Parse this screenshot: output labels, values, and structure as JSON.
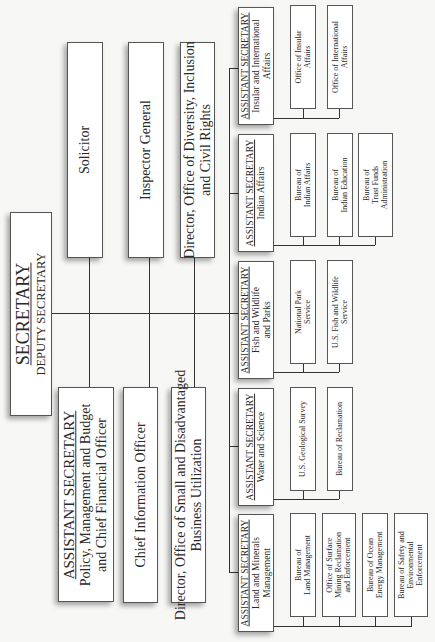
{
  "chart": {
    "orientation": "rotated-90-ccw",
    "root": {
      "title": "SECRETARY",
      "subtitle": "DEPUTY SECRETARY"
    },
    "staff_top": [
      {
        "lines": [
          "Solicitor"
        ]
      },
      {
        "lines": [
          "Inspector General"
        ]
      },
      {
        "lines": [
          "Director, Office of Diversity, Inclusion",
          "and Civil Rights"
        ]
      }
    ],
    "staff_bottom": [
      {
        "title": "ASSISTANT SECRETARY",
        "lines": [
          "Policy, Management and Budget",
          "and Chief Financial Officer"
        ]
      },
      {
        "lines": [
          "Chief Information Officer"
        ]
      },
      {
        "lines": [
          "Director, Office of Small and Disadvantaged",
          "Business Utilization"
        ]
      }
    ],
    "assistant_secretaries": [
      {
        "title": "ASSISTANT SECRETARY",
        "lines": [
          "Insular and International",
          "Affairs"
        ],
        "bureaus": [
          {
            "lines": [
              "Office of Insular",
              "Affairs"
            ]
          },
          {
            "lines": [
              "Office of International",
              "Affairs"
            ]
          }
        ]
      },
      {
        "title": "ASSISTANT SECRETARY",
        "lines": [
          "Indian Affairs"
        ],
        "bureaus": [
          {
            "lines": [
              "Bureau of",
              "Indian Affairs"
            ]
          },
          {
            "lines": [
              "Bureau of",
              "Indian Education"
            ]
          },
          {
            "lines": [
              "Bureau of",
              "Trust Funds",
              "Administration"
            ]
          }
        ]
      },
      {
        "title": "ASSISTANT SECRETARY",
        "lines": [
          "Fish and Wildlife",
          "and Parks"
        ],
        "bureaus": [
          {
            "lines": [
              "National Park",
              "Service"
            ]
          },
          {
            "lines": [
              "U.S. Fish and Wildlife",
              "Service"
            ]
          }
        ]
      },
      {
        "title": "ASSISTANT SECRETARY",
        "lines": [
          "Water and Science"
        ],
        "bureaus": [
          {
            "lines": [
              "U.S. Geological Survey"
            ]
          },
          {
            "lines": [
              "Bureau of Reclamation"
            ]
          }
        ]
      },
      {
        "title": "ASSISTANT SECRETARY",
        "lines": [
          "Land and Minerals",
          "Management"
        ],
        "bureaus": [
          {
            "lines": [
              "Bureau of",
              "Land Management"
            ]
          },
          {
            "lines": [
              "Office of Surface",
              "Mining Reclamation",
              "and Enforcement"
            ]
          },
          {
            "lines": [
              "Bureau of Ocean",
              "Energy Management"
            ]
          },
          {
            "lines": [
              "Bureau of Safety and",
              "Environmental",
              "Enforcement"
            ]
          }
        ]
      }
    ]
  }
}
